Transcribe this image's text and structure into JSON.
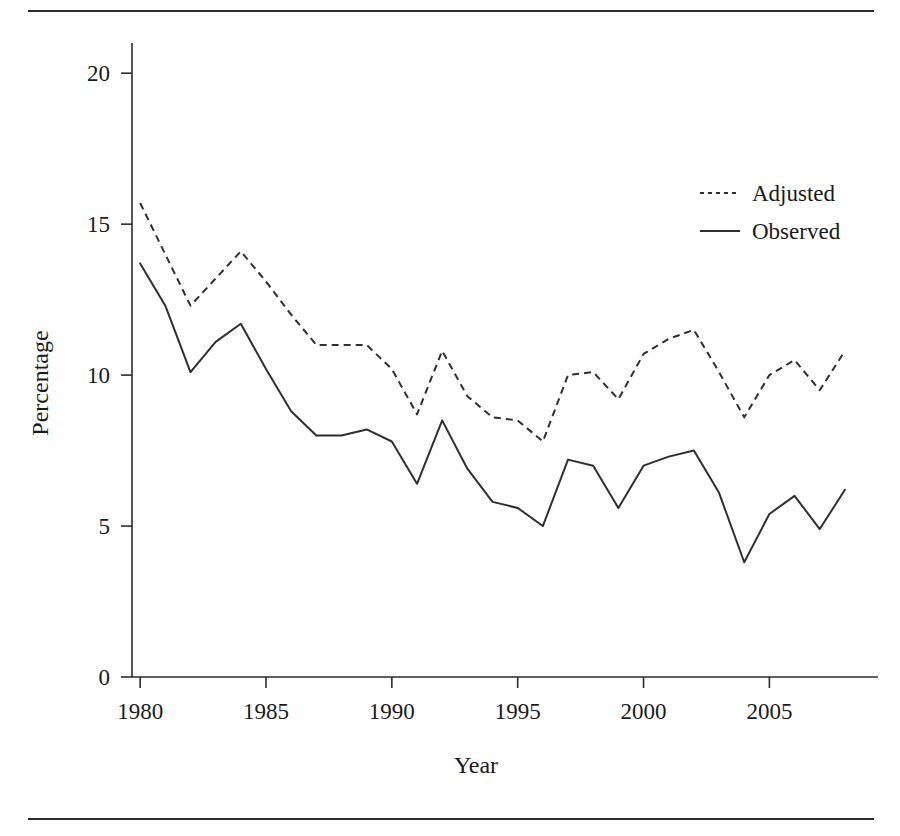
{
  "chart_data": {
    "type": "line",
    "title": "",
    "xlabel": "Year",
    "ylabel": "Percentage",
    "xlim": [
      1979.2,
      2008.6
    ],
    "ylim": [
      0,
      21
    ],
    "grid": false,
    "legend_position": "upper-right",
    "x": [
      1980,
      1981,
      1982,
      1983,
      1984,
      1985,
      1986,
      1987,
      1988,
      1989,
      1990,
      1991,
      1992,
      1993,
      1994,
      1995,
      1996,
      1997,
      1998,
      1999,
      2000,
      2001,
      2002,
      2003,
      2004,
      2005,
      2006,
      2007,
      2008
    ],
    "xticks": [
      1980,
      1985,
      1990,
      1995,
      2000,
      2005
    ],
    "xtick_labels": [
      "1980",
      "1985",
      "1990",
      "1995",
      "2000",
      "2005"
    ],
    "yticks": [
      0,
      5,
      10,
      15,
      20
    ],
    "ytick_labels": [
      "0",
      "5",
      "10",
      "15",
      "20"
    ],
    "series": [
      {
        "name": "Adjusted",
        "style": "dotted",
        "values": [
          15.7,
          14.0,
          12.3,
          13.2,
          14.1,
          13.1,
          12.0,
          11.0,
          11.0,
          11.0,
          10.2,
          8.7,
          10.8,
          9.3,
          8.6,
          8.5,
          7.8,
          10.0,
          10.1,
          9.2,
          10.7,
          11.2,
          11.5,
          10.1,
          8.6,
          10.0,
          10.5,
          9.5,
          10.8
        ]
      },
      {
        "name": "Observed",
        "style": "solid",
        "values": [
          13.7,
          12.3,
          10.1,
          11.1,
          11.7,
          10.2,
          8.8,
          8.0,
          8.0,
          8.2,
          7.8,
          6.4,
          8.5,
          6.9,
          5.8,
          5.6,
          5.0,
          7.2,
          7.0,
          5.6,
          7.0,
          7.3,
          7.5,
          6.1,
          3.8,
          5.4,
          6.0,
          4.9,
          6.2
        ]
      }
    ]
  },
  "legend": {
    "entries": [
      {
        "label": "Adjusted",
        "style": "dotted"
      },
      {
        "label": "Observed",
        "style": "solid"
      }
    ]
  },
  "colors": {
    "ink": "#2f2f2f",
    "rule": "#2b2b2b",
    "background": "#ffffff"
  }
}
